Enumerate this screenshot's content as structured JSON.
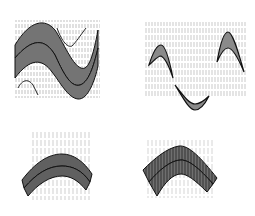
{
  "diagram": {
    "panels": [
      {
        "id": "a",
        "description": "S-shaped folded layer pair with vertical cleavage, upper-left"
      },
      {
        "id": "b",
        "description": "isolated fold hinges (two antiform caps and one synform trough) in vertically cleaved matrix, upper-right"
      },
      {
        "id": "c",
        "description": "rounded antiform of two layers with fanning cleavage, lower-left"
      },
      {
        "id": "d",
        "description": "chevron-like antiform of two layers with fanning cleavage, lower-right"
      }
    ],
    "colors": {
      "layer_fill": "#8a8a8a",
      "outline": "#111111",
      "cleavage": "#555555",
      "background": "#ffffff"
    }
  }
}
